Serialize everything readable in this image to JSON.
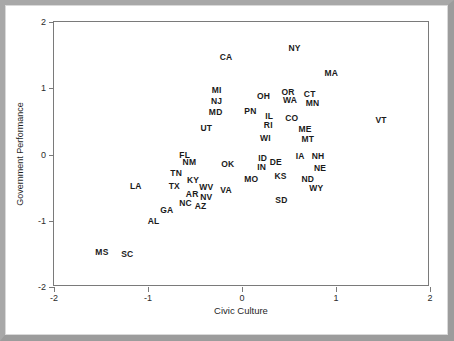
{
  "chart_data": {
    "type": "scatter",
    "title": "",
    "xlabel": "Civic Culture",
    "ylabel": "Government Performance",
    "xlim": [
      -2,
      2
    ],
    "ylim": [
      -2,
      2
    ],
    "xticks": [
      "-2",
      "-1",
      "0",
      "1",
      "2"
    ],
    "xtick_values": [
      -2,
      -1,
      0,
      1,
      2
    ],
    "yticks": [
      "2",
      "1",
      "0",
      "-1",
      "-2"
    ],
    "ytick_values": [
      2,
      1,
      0,
      -1,
      -2
    ],
    "grid": false,
    "legend": null,
    "marker_style": "text-label",
    "point_color": "#1a1a1a",
    "points": [
      {
        "label": "NY",
        "x": 0.56,
        "y": 1.61
      },
      {
        "label": "CA",
        "x": -0.17,
        "y": 1.47
      },
      {
        "label": "MA",
        "x": 0.95,
        "y": 1.23
      },
      {
        "label": "MI",
        "x": -0.27,
        "y": 0.97
      },
      {
        "label": "OR",
        "x": 0.49,
        "y": 0.95
      },
      {
        "label": "CT",
        "x": 0.72,
        "y": 0.92
      },
      {
        "label": "OH",
        "x": 0.23,
        "y": 0.88
      },
      {
        "label": "WA",
        "x": 0.51,
        "y": 0.83
      },
      {
        "label": "NJ",
        "x": -0.27,
        "y": 0.81
      },
      {
        "label": "MN",
        "x": 0.75,
        "y": 0.77
      },
      {
        "label": "MD",
        "x": -0.28,
        "y": 0.64
      },
      {
        "label": "PN",
        "x": 0.09,
        "y": 0.65
      },
      {
        "label": "IL",
        "x": 0.29,
        "y": 0.58
      },
      {
        "label": "CO",
        "x": 0.53,
        "y": 0.55
      },
      {
        "label": "VT",
        "x": 1.48,
        "y": 0.52
      },
      {
        "label": "RI",
        "x": 0.28,
        "y": 0.44
      },
      {
        "label": "UT",
        "x": -0.38,
        "y": 0.4
      },
      {
        "label": "ME",
        "x": 0.67,
        "y": 0.39
      },
      {
        "label": "WI",
        "x": 0.25,
        "y": 0.25
      },
      {
        "label": "MT",
        "x": 0.7,
        "y": 0.23
      },
      {
        "label": "FL",
        "x": -0.61,
        "y": 0.0
      },
      {
        "label": "IA",
        "x": 0.62,
        "y": -0.03
      },
      {
        "label": "NH",
        "x": 0.81,
        "y": -0.02
      },
      {
        "label": "ID",
        "x": 0.22,
        "y": -0.05
      },
      {
        "label": "NM",
        "x": -0.56,
        "y": -0.12
      },
      {
        "label": "DE",
        "x": 0.36,
        "y": -0.12
      },
      {
        "label": "OK",
        "x": -0.15,
        "y": -0.14
      },
      {
        "label": "IN",
        "x": 0.21,
        "y": -0.19
      },
      {
        "label": "NE",
        "x": 0.83,
        "y": -0.2
      },
      {
        "label": "TN",
        "x": -0.7,
        "y": -0.28
      },
      {
        "label": "KS",
        "x": 0.41,
        "y": -0.33
      },
      {
        "label": "MO",
        "x": 0.1,
        "y": -0.37
      },
      {
        "label": "ND",
        "x": 0.7,
        "y": -0.37
      },
      {
        "label": "KY",
        "x": -0.52,
        "y": -0.39
      },
      {
        "label": "LA",
        "x": -1.13,
        "y": -0.47
      },
      {
        "label": "TX",
        "x": -0.72,
        "y": -0.47
      },
      {
        "label": "WV",
        "x": -0.38,
        "y": -0.49
      },
      {
        "label": "WY",
        "x": 0.79,
        "y": -0.51
      },
      {
        "label": "VA",
        "x": -0.17,
        "y": -0.54
      },
      {
        "label": "AR",
        "x": -0.53,
        "y": -0.59
      },
      {
        "label": "NV",
        "x": -0.38,
        "y": -0.64
      },
      {
        "label": "SD",
        "x": 0.42,
        "y": -0.68
      },
      {
        "label": "NC",
        "x": -0.6,
        "y": -0.73
      },
      {
        "label": "AZ",
        "x": -0.44,
        "y": -0.78
      },
      {
        "label": "GA",
        "x": -0.8,
        "y": -0.84
      },
      {
        "label": "AL",
        "x": -0.94,
        "y": -1.0
      },
      {
        "label": "MS",
        "x": -1.49,
        "y": -1.47
      },
      {
        "label": "SC",
        "x": -1.22,
        "y": -1.5
      }
    ]
  },
  "axes": {
    "x_axis_title": "Civic Culture",
    "y_axis_title": "Government Performance"
  }
}
